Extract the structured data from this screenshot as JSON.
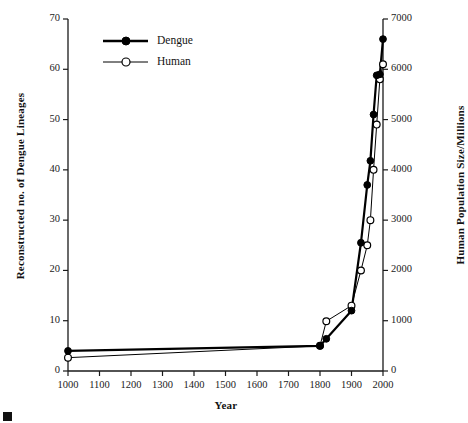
{
  "chart_data": {
    "type": "line",
    "title": "",
    "xlabel": "Year",
    "ylabel": "Reconstructed no. of Dengue Lineages",
    "y2label": "Human Population Size/Millions",
    "xlim": [
      1000,
      2000
    ],
    "ylim": [
      0,
      70
    ],
    "y2lim": [
      0,
      7000
    ],
    "grid": false,
    "legend_position": "upper-left-inside",
    "x_ticks": [
      1000,
      1100,
      1200,
      1300,
      1400,
      1500,
      1600,
      1700,
      1800,
      1900,
      2000
    ],
    "x_tick_labels": [
      "1000",
      "1100",
      "1200",
      "1300",
      "1400",
      "1500",
      "1600",
      "1700",
      "1800",
      "1900",
      "2000"
    ],
    "y_ticks": [
      0,
      10,
      20,
      30,
      40,
      50,
      60,
      70
    ],
    "y_tick_labels": [
      "0",
      "10",
      "20",
      "30",
      "40",
      "50",
      "60",
      "70"
    ],
    "y2_ticks": [
      0,
      1000,
      2000,
      3000,
      4000,
      5000,
      6000,
      7000
    ],
    "y2_tick_labels": [
      "0",
      "1000",
      "2000",
      "3000",
      "4000",
      "5000",
      "6000",
      "7000"
    ],
    "series": [
      {
        "name": "Dengue",
        "axis": "left",
        "color": "#000000",
        "line_width": 2.2,
        "marker": "filled-circle",
        "x": [
          1000,
          1800,
          1820,
          1900,
          1930,
          1950,
          1960,
          1970,
          1980,
          1990,
          2000
        ],
        "values": [
          4.0,
          5.0,
          6.4,
          12.0,
          25.5,
          37.0,
          41.8,
          51.0,
          58.8,
          59.0,
          66.0
        ]
      },
      {
        "name": "Human",
        "axis": "right",
        "color": "#000000",
        "line_width": 1.0,
        "marker": "open-circle",
        "x": [
          1000,
          1800,
          1820,
          1900,
          1930,
          1950,
          1960,
          1970,
          1980,
          1990,
          2000
        ],
        "values": [
          265,
          500,
          990,
          1300,
          2000,
          2500,
          3000,
          4000,
          4900,
          5800,
          6100
        ]
      }
    ]
  },
  "legend": {
    "entries": [
      {
        "label": "Dengue",
        "marker": "filled-circle"
      },
      {
        "label": "Human",
        "marker": "open-circle"
      }
    ]
  },
  "axis_titles": {
    "left": "Reconstructed no. of Dengue Lineages",
    "right": "Human Population Size/Millions",
    "bottom": "Year"
  }
}
